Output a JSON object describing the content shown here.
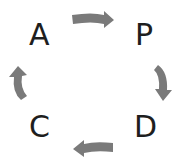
{
  "diagram": {
    "nodes": [
      {
        "id": "P",
        "label": "P"
      },
      {
        "id": "D",
        "label": "D"
      },
      {
        "id": "C",
        "label": "C"
      },
      {
        "id": "A",
        "label": "A"
      }
    ],
    "edges": [
      {
        "from": "A",
        "to": "P"
      },
      {
        "from": "P",
        "to": "D"
      },
      {
        "from": "D",
        "to": "C"
      },
      {
        "from": "C",
        "to": "A"
      }
    ],
    "colors": {
      "arrow": "#7a7a7a",
      "text": "#1e1e1e",
      "background": "#ffffff"
    }
  }
}
